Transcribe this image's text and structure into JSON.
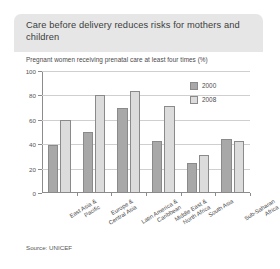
{
  "figure": {
    "title": "Care before delivery reduces risks for mothers and children",
    "source": "Source: UNICEF"
  },
  "colors": {
    "title_band": "#e6e6e6",
    "bar_2000": "#a8a8a8",
    "bar_2008": "#dcdcdc",
    "bar_outline": "#8a8a8a",
    "axis": "#8c8c8c",
    "gridline": "#cfcfcf"
  },
  "chart_data": {
    "type": "bar",
    "title": "Care before delivery reduces risks for mothers and children",
    "subtitle": "Pregnant women receiving prenatal care at least four times (%)",
    "xlabel": "",
    "ylabel": "",
    "ylim": [
      0,
      100
    ],
    "yticks": [
      0,
      20,
      40,
      60,
      80,
      100
    ],
    "grid": true,
    "legend_position": "top-right",
    "categories": [
      "East Asia & Pacific",
      "Europe & Central Asia",
      "Latin America & Caribbean",
      "Middle East & North Africa",
      "South Asia",
      "Sub-Saharan Africa"
    ],
    "series": [
      {
        "name": "2000",
        "values": [
          39,
          50,
          70,
          43,
          25,
          44
        ]
      },
      {
        "name": "2008",
        "values": [
          60,
          80,
          84,
          71,
          31,
          43
        ]
      }
    ]
  }
}
